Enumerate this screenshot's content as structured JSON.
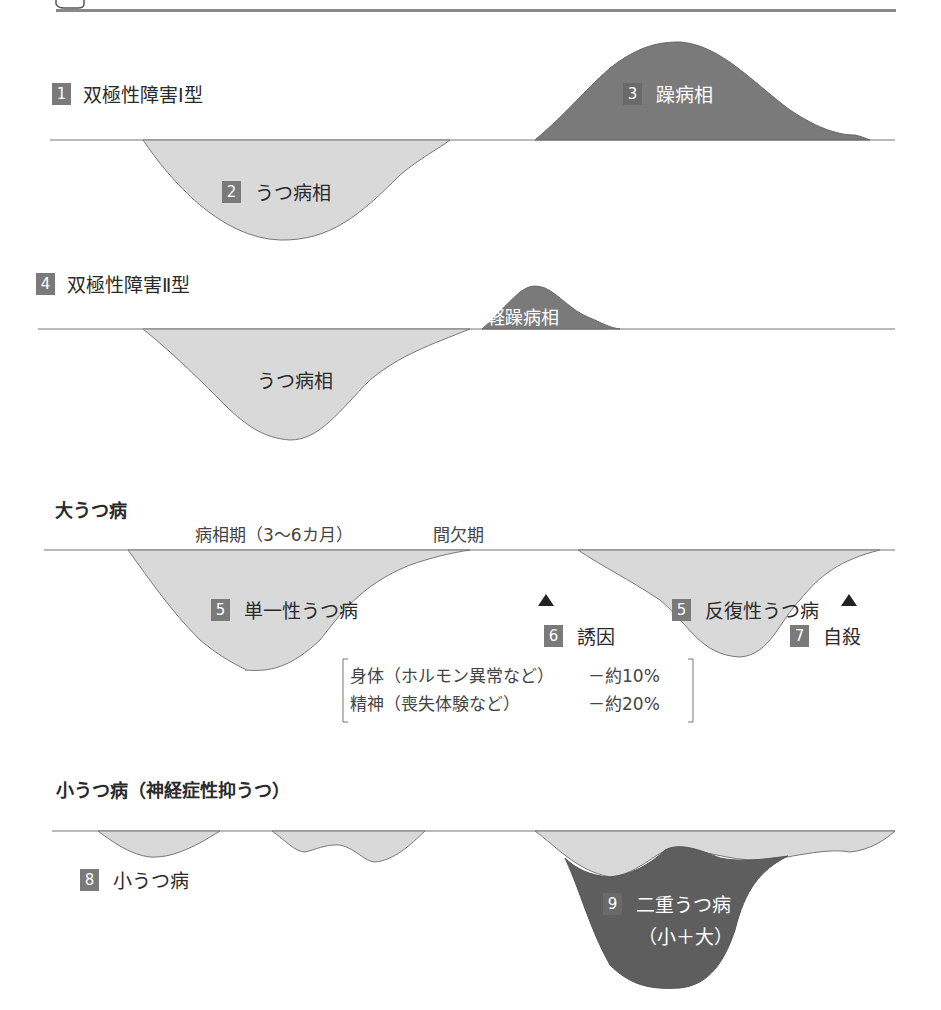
{
  "colors": {
    "baseline": "#777777",
    "depression_fill": "#d9d9d9",
    "mania_fill": "#7a7a7a",
    "double_depression_fill": "#5e5e5e",
    "number_box": "#7a7a7a",
    "top_rule": "#888888"
  },
  "sections": {
    "bipolar1": {
      "num": "1",
      "title": "双極性障害Ⅰ型",
      "mania": {
        "num": "3",
        "label": "躁病相"
      },
      "depression": {
        "num": "2",
        "label": "うつ病相"
      }
    },
    "bipolar2": {
      "num": "4",
      "title": "双極性障害Ⅱ型",
      "hypomania": {
        "label": "軽躁病相"
      },
      "depression": {
        "label": "うつ病相"
      }
    },
    "major": {
      "title": "大うつ病",
      "phase_label": "病相期（3～6カ月）",
      "interval_label": "間欠期",
      "single": {
        "num": "5",
        "label": "単一性うつ病"
      },
      "recurrent": {
        "num": "5",
        "label": "反復性うつ病"
      },
      "trigger": {
        "num": "6",
        "label": "誘因",
        "marker": "▲"
      },
      "suicide": {
        "num": "7",
        "label": "自殺",
        "marker": "▲"
      },
      "causes": [
        {
          "name": "身体（ホルモン異常など）",
          "value": "－約10%"
        },
        {
          "name": "精神（喪失体験など）",
          "value": "－約20%"
        }
      ]
    },
    "minor": {
      "title": "小うつ病（神経症性抑うつ）",
      "minor_dep": {
        "num": "8",
        "label": "小うつ病"
      },
      "double_dep": {
        "num": "9",
        "label": "二重うつ病",
        "sub": "（小＋大）"
      }
    }
  }
}
